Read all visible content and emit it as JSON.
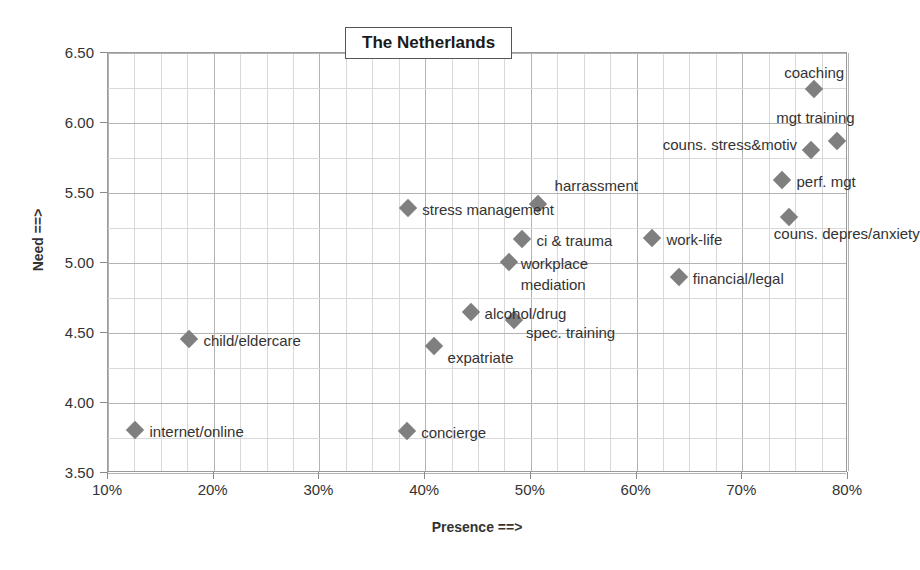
{
  "chart_data": {
    "type": "scatter",
    "title": "The Netherlands",
    "xlabel": "Presence ==>",
    "ylabel": "Need ==>",
    "xlim": [
      10,
      80
    ],
    "ylim": [
      3.5,
      6.5
    ],
    "xticks": [
      "10%",
      "20%",
      "30%",
      "40%",
      "50%",
      "60%",
      "70%",
      "80%"
    ],
    "xtick_values": [
      10,
      20,
      30,
      40,
      50,
      60,
      70,
      80
    ],
    "yticks": [
      "3.50",
      "4.00",
      "4.50",
      "5.00",
      "5.50",
      "6.00",
      "6.50"
    ],
    "ytick_values": [
      3.5,
      4.0,
      4.5,
      5.0,
      5.5,
      6.0,
      6.5
    ],
    "grid": true,
    "grid_minor_x_step": 2.5,
    "grid_minor_y_step": 0.25,
    "legend": "none",
    "marker": "diamond",
    "marker_color": "#7f7f7f",
    "points": [
      {
        "label": "coaching",
        "x": 76.8,
        "y": 6.24,
        "label_pos": "center",
        "label_dx": 0,
        "label_dy": -17
      },
      {
        "label": "mgt training",
        "x": 79.0,
        "y": 5.87,
        "label_pos": "center",
        "label_dx": -22,
        "label_dy": -24
      },
      {
        "label": "couns. stress&motiv",
        "x": 76.5,
        "y": 5.81,
        "label_pos": "left",
        "label_dx": -14,
        "label_dy": -6
      },
      {
        "label": "perf. mgt",
        "x": 73.8,
        "y": 5.59,
        "label_pos": "right",
        "label_dx": 14,
        "label_dy": 1
      },
      {
        "label": "couns. depres/anxiety",
        "x": 74.4,
        "y": 5.33,
        "label_pos": "center",
        "label_dx": 58,
        "label_dy": 16
      },
      {
        "label": "harrassment",
        "x": 50.7,
        "y": 5.42,
        "label_pos": "center",
        "label_dx": 58,
        "label_dy": -19
      },
      {
        "label": "stress management",
        "x": 38.4,
        "y": 5.39,
        "label_pos": "right",
        "label_dx": 14,
        "label_dy": 1
      },
      {
        "label": "ci & trauma",
        "x": 49.2,
        "y": 5.17,
        "label_pos": "right",
        "label_dx": 14,
        "label_dy": 1
      },
      {
        "label": "work-life",
        "x": 61.5,
        "y": 5.18,
        "label_pos": "right",
        "label_dx": 14,
        "label_dy": 1
      },
      {
        "label": "workplace mediation",
        "x": 47.9,
        "y": 5.01,
        "label_pos": "right",
        "label_dx": 12,
        "label_dy": 1
      },
      {
        "label": "financial/legal",
        "x": 64.0,
        "y": 4.9,
        "label_pos": "right",
        "label_dx": 14,
        "label_dy": 1
      },
      {
        "label": "alcohol/drug",
        "x": 44.3,
        "y": 4.65,
        "label_pos": "right",
        "label_dx": 14,
        "label_dy": 1
      },
      {
        "label": "spec. training",
        "x": 48.4,
        "y": 4.59,
        "label_pos": "right",
        "label_dx": 12,
        "label_dy": 12
      },
      {
        "label": "child/eldercare",
        "x": 17.7,
        "y": 4.46,
        "label_pos": "right",
        "label_dx": 14,
        "label_dy": 1
      },
      {
        "label": "expatriate",
        "x": 40.8,
        "y": 4.41,
        "label_pos": "right",
        "label_dx": 14,
        "label_dy": 11
      },
      {
        "label": "internet/online",
        "x": 12.6,
        "y": 3.81,
        "label_pos": "right",
        "label_dx": 14,
        "label_dy": 1
      },
      {
        "label": "concierge",
        "x": 38.3,
        "y": 3.8,
        "label_pos": "right",
        "label_dx": 14,
        "label_dy": 1
      }
    ],
    "label_overrides": [
      {
        "label": "workplace",
        "x": 47.9,
        "y": 5.01,
        "dx": 12,
        "dy": 1
      },
      {
        "label": "mediation",
        "x": 47.9,
        "y": 5.01,
        "dx": 12,
        "dy": 22
      }
    ]
  }
}
